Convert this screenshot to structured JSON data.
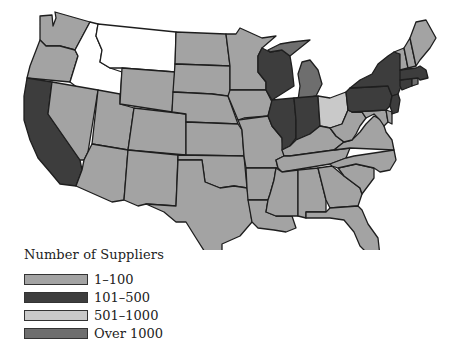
{
  "legend": {
    "title": "Number of Suppliers",
    "items": [
      {
        "label": "1–100",
        "color": "#a3a3a3"
      },
      {
        "label": "101–500",
        "color": "#3d3d3d"
      },
      {
        "label": "501–1000",
        "color": "#c9c9c9"
      },
      {
        "label": "Over 1000",
        "color": "#6e6e6e"
      }
    ]
  },
  "colors": {
    "none": "#ffffff",
    "c1_100": "#a3a3a3",
    "c101_500": "#3d3d3d",
    "c501_1000": "#c9c9c9",
    "over1000": "#6e6e6e"
  },
  "states": [
    {
      "id": "WA",
      "category": "1-100"
    },
    {
      "id": "OR",
      "category": "1-100"
    },
    {
      "id": "CA",
      "category": "101-500"
    },
    {
      "id": "ID",
      "category": "none"
    },
    {
      "id": "MT",
      "category": "none"
    },
    {
      "id": "NV",
      "category": "1-100"
    },
    {
      "id": "UT",
      "category": "1-100"
    },
    {
      "id": "AZ",
      "category": "1-100"
    },
    {
      "id": "WY",
      "category": "1-100"
    },
    {
      "id": "CO",
      "category": "1-100"
    },
    {
      "id": "NM",
      "category": "1-100"
    },
    {
      "id": "ND",
      "category": "1-100"
    },
    {
      "id": "SD",
      "category": "1-100"
    },
    {
      "id": "NE",
      "category": "1-100"
    },
    {
      "id": "KS",
      "category": "1-100"
    },
    {
      "id": "OK",
      "category": "1-100"
    },
    {
      "id": "TX",
      "category": "1-100"
    },
    {
      "id": "MN",
      "category": "1-100"
    },
    {
      "id": "IA",
      "category": "1-100"
    },
    {
      "id": "MO",
      "category": "1-100"
    },
    {
      "id": "AR",
      "category": "1-100"
    },
    {
      "id": "LA",
      "category": "1-100"
    },
    {
      "id": "WI",
      "category": "101-500"
    },
    {
      "id": "IL",
      "category": "101-500"
    },
    {
      "id": "IN",
      "category": "101-500"
    },
    {
      "id": "MI",
      "category": "over-1000"
    },
    {
      "id": "OH",
      "category": "501-1000"
    },
    {
      "id": "KY",
      "category": "1-100"
    },
    {
      "id": "TN",
      "category": "1-100"
    },
    {
      "id": "MS",
      "category": "1-100"
    },
    {
      "id": "AL",
      "category": "1-100"
    },
    {
      "id": "GA",
      "category": "1-100"
    },
    {
      "id": "FL",
      "category": "1-100"
    },
    {
      "id": "SC",
      "category": "1-100"
    },
    {
      "id": "NC",
      "category": "1-100"
    },
    {
      "id": "VA",
      "category": "1-100"
    },
    {
      "id": "WV",
      "category": "1-100"
    },
    {
      "id": "MD",
      "category": "1-100"
    },
    {
      "id": "DE",
      "category": "1-100"
    },
    {
      "id": "PA",
      "category": "101-500"
    },
    {
      "id": "NY",
      "category": "101-500"
    },
    {
      "id": "NJ",
      "category": "101-500"
    },
    {
      "id": "CT",
      "category": "101-500"
    },
    {
      "id": "RI",
      "category": "over-1000"
    },
    {
      "id": "MA",
      "category": "101-500"
    },
    {
      "id": "VT",
      "category": "1-100"
    },
    {
      "id": "NH",
      "category": "1-100"
    },
    {
      "id": "ME",
      "category": "1-100"
    }
  ]
}
